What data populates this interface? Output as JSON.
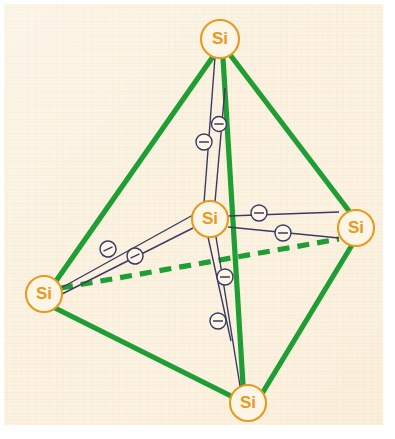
{
  "figure": {
    "background_color": "#fbf2e0",
    "outer_color": "#ffffff",
    "cage_color": "#1f9e35",
    "atom_stroke_color": "#e8991f",
    "atom_fill_color": "#fdf6e6",
    "bond_color": "#3a3a63",
    "electron_fill_color": "#fdf6e6",
    "paper": {
      "x": 4,
      "y": 4,
      "width": 379,
      "height": 421
    }
  },
  "atoms": [
    {
      "id": "si-top",
      "label": "Si",
      "cx": 220,
      "cy": 39,
      "r": 19
    },
    {
      "id": "si-left",
      "label": "Si",
      "cx": 44,
      "cy": 294,
      "r": 18
    },
    {
      "id": "si-right",
      "label": "Si",
      "cx": 356,
      "cy": 228,
      "r": 18
    },
    {
      "id": "si-bottom",
      "label": "Si",
      "cx": 248,
      "cy": 403,
      "r": 18
    },
    {
      "id": "si-center",
      "label": "Si",
      "cx": 210,
      "cy": 219,
      "r": 18
    }
  ],
  "cage_edges": [
    {
      "id": "edge-top-left",
      "x1": 212,
      "y1": 58,
      "x2": 56,
      "y2": 281,
      "style": "solid"
    },
    {
      "id": "edge-top-right",
      "x1": 231,
      "y1": 56,
      "x2": 349,
      "y2": 211,
      "style": "solid"
    },
    {
      "id": "edge-top-bottom",
      "x1": 223,
      "y1": 58,
      "x2": 243,
      "y2": 385,
      "style": "solid"
    },
    {
      "id": "edge-left-bottom",
      "x1": 53,
      "y1": 307,
      "x2": 231,
      "y2": 396,
      "style": "solid"
    },
    {
      "id": "edge-right-bottom",
      "x1": 352,
      "y1": 245,
      "x2": 263,
      "y2": 392,
      "style": "solid"
    },
    {
      "id": "edge-left-right",
      "x1": 61,
      "y1": 288,
      "x2": 339,
      "y2": 239,
      "style": "dashed"
    }
  ],
  "bonds": [
    {
      "id": "bond-center-top-a",
      "x1": 215,
      "y1": 57,
      "x2": 204,
      "y2": 203
    },
    {
      "id": "bond-center-top-b",
      "x1": 225,
      "y1": 88,
      "x2": 215,
      "y2": 202
    },
    {
      "id": "bond-center-left-a",
      "x1": 61,
      "y1": 288,
      "x2": 193,
      "y2": 215
    },
    {
      "id": "bond-center-left-b",
      "x1": 60,
      "y1": 295,
      "x2": 193,
      "y2": 228
    },
    {
      "id": "bond-center-right-a",
      "x1": 228,
      "y1": 216,
      "x2": 339,
      "y2": 212
    },
    {
      "id": "bond-center-right-b",
      "x1": 228,
      "y1": 227,
      "x2": 339,
      "y2": 238
    },
    {
      "id": "bond-center-bottom-a",
      "x1": 208,
      "y1": 237,
      "x2": 231,
      "y2": 341
    },
    {
      "id": "bond-center-bottom-b",
      "x1": 216,
      "y1": 237,
      "x2": 241,
      "y2": 392
    }
  ],
  "electrons": [
    {
      "id": "electron-top-1",
      "cx": 204,
      "cy": 142,
      "r": 8,
      "angle": 0,
      "charge": "-"
    },
    {
      "id": "electron-top-2",
      "cx": 219,
      "cy": 124,
      "r": 7.5,
      "angle": 0,
      "charge": "-"
    },
    {
      "id": "electron-left-1",
      "cx": 108,
      "cy": 249,
      "r": 8,
      "angle": -25,
      "charge": "-"
    },
    {
      "id": "electron-left-2",
      "cx": 135,
      "cy": 256,
      "r": 8,
      "angle": -25,
      "charge": "-"
    },
    {
      "id": "electron-right-1",
      "cx": 259,
      "cy": 213,
      "r": 8,
      "angle": 0,
      "charge": "-"
    },
    {
      "id": "electron-right-2",
      "cx": 283,
      "cy": 233,
      "r": 8,
      "angle": 0,
      "charge": "-"
    },
    {
      "id": "electron-bottom-1",
      "cx": 225,
      "cy": 277,
      "r": 8,
      "angle": 0,
      "charge": "-"
    },
    {
      "id": "electron-bottom-2",
      "cx": 218,
      "cy": 321,
      "r": 8,
      "angle": 0,
      "charge": "-"
    }
  ]
}
